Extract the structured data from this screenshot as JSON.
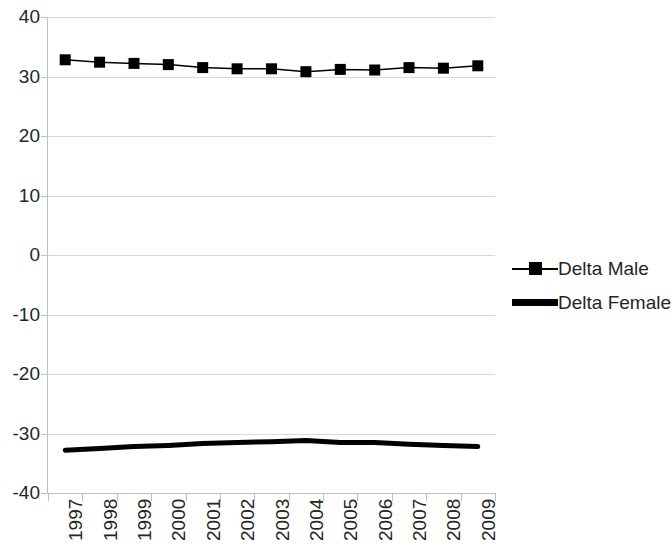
{
  "chart_data": {
    "type": "line",
    "title": "",
    "subtitle": "",
    "xlabel": "",
    "ylabel": "",
    "categories": [
      "1997",
      "1998",
      "1999",
      "2000",
      "2001",
      "2002",
      "2003",
      "2004",
      "2005",
      "2006",
      "2007",
      "2008",
      "2009"
    ],
    "ylim": [
      -40,
      40
    ],
    "yticks": [
      40,
      30,
      20,
      10,
      0,
      -10,
      -20,
      -30,
      -40
    ],
    "ytick_labels": [
      "40",
      "30",
      "20",
      "10",
      "0",
      "-10",
      "-20",
      "-30",
      "-40"
    ],
    "grid": true,
    "legend_position": "right",
    "series": [
      {
        "name": "Delta Male",
        "marker": "square",
        "color": "#000000",
        "line_width": 1.5,
        "values": [
          32.8,
          32.4,
          32.2,
          32.0,
          31.5,
          31.3,
          31.3,
          30.8,
          31.2,
          31.1,
          31.5,
          31.4,
          31.8
        ]
      },
      {
        "name": "Delta Female",
        "marker": "none",
        "color": "#000000",
        "line_width": 5,
        "values": [
          -32.8,
          -32.5,
          -32.2,
          -32.0,
          -31.7,
          -31.5,
          -31.4,
          -31.2,
          -31.5,
          -31.5,
          -31.8,
          -32.0,
          -32.2
        ]
      }
    ]
  },
  "legend": {
    "items": [
      {
        "label": "Delta Male",
        "key": "line-square-marker"
      },
      {
        "label": "Delta Female",
        "key": "thick-line"
      }
    ]
  }
}
